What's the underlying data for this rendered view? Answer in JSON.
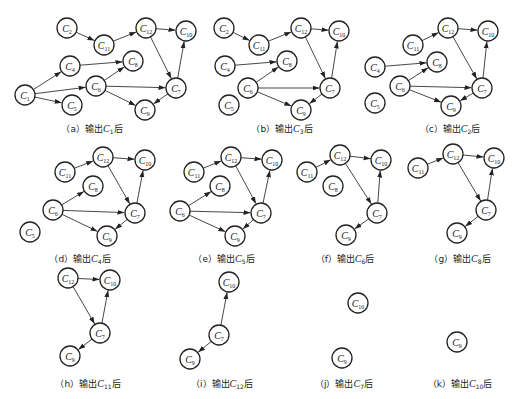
{
  "figure": {
    "node_radius": 10,
    "colors": {
      "stroke": "#222222",
      "edge": "#333333",
      "background": "#ffffff"
    },
    "panels": [
      {
        "id": "a",
        "caption_prefix": "（a）输出",
        "caption_node": "C",
        "caption_sub": "1",
        "caption_suffix": "后",
        "caption_x": 92,
        "caption_y": 122,
        "nodes": [
          {
            "id": "C2",
            "sub": "2",
            "x": 67,
            "y": 28
          },
          {
            "id": "C11",
            "sub": "11",
            "x": 104,
            "y": 45
          },
          {
            "id": "C12",
            "sub": "12",
            "x": 146,
            "y": 28
          },
          {
            "id": "C10",
            "sub": "10",
            "x": 186,
            "y": 31
          },
          {
            "id": "C4",
            "sub": "4",
            "x": 70,
            "y": 66
          },
          {
            "id": "C8",
            "sub": "8",
            "x": 133,
            "y": 61
          },
          {
            "id": "C1",
            "sub": "1",
            "x": 25,
            "y": 95
          },
          {
            "id": "C6",
            "sub": "6",
            "x": 96,
            "y": 86
          },
          {
            "id": "C7",
            "sub": "7",
            "x": 176,
            "y": 88
          },
          {
            "id": "C5",
            "sub": "5",
            "x": 72,
            "y": 105
          },
          {
            "id": "C9",
            "sub": "9",
            "x": 145,
            "y": 110
          }
        ],
        "edges": [
          [
            "C2",
            "C11"
          ],
          [
            "C11",
            "C12"
          ],
          [
            "C12",
            "C10"
          ],
          [
            "C12",
            "C7"
          ],
          [
            "C7",
            "C10"
          ],
          [
            "C1",
            "C4"
          ],
          [
            "C1",
            "C6"
          ],
          [
            "C1",
            "C5"
          ],
          [
            "C4",
            "C8"
          ],
          [
            "C6",
            "C8"
          ],
          [
            "C6",
            "C7"
          ],
          [
            "C6",
            "C9"
          ],
          [
            "C7",
            "C9"
          ]
        ]
      },
      {
        "id": "b",
        "caption_prefix": "（b）输出",
        "caption_node": "C",
        "caption_sub": "3",
        "caption_suffix": "后",
        "caption_x": 282,
        "caption_y": 122,
        "nodes": [
          {
            "id": "C2",
            "sub": "2",
            "x": 224,
            "y": 28
          },
          {
            "id": "C11",
            "sub": "11",
            "x": 259,
            "y": 45
          },
          {
            "id": "C12",
            "sub": "12",
            "x": 301,
            "y": 28
          },
          {
            "id": "C10",
            "sub": "10",
            "x": 339,
            "y": 31
          },
          {
            "id": "C4",
            "sub": "4",
            "x": 225,
            "y": 66
          },
          {
            "id": "C8",
            "sub": "8",
            "x": 287,
            "y": 61
          },
          {
            "id": "C6",
            "sub": "6",
            "x": 248,
            "y": 88
          },
          {
            "id": "C7",
            "sub": "7",
            "x": 330,
            "y": 88
          },
          {
            "id": "C5",
            "sub": "5",
            "x": 229,
            "y": 105
          },
          {
            "id": "C9",
            "sub": "9",
            "x": 301,
            "y": 110
          }
        ],
        "edges": [
          [
            "C2",
            "C11"
          ],
          [
            "C11",
            "C12"
          ],
          [
            "C12",
            "C10"
          ],
          [
            "C12",
            "C7"
          ],
          [
            "C7",
            "C10"
          ],
          [
            "C4",
            "C8"
          ],
          [
            "C6",
            "C8"
          ],
          [
            "C6",
            "C7"
          ],
          [
            "C6",
            "C9"
          ],
          [
            "C7",
            "C9"
          ]
        ]
      },
      {
        "id": "c",
        "caption_prefix": "（c）输出",
        "caption_node": "C",
        "caption_sub": "2",
        "caption_suffix": "后",
        "caption_x": 450,
        "caption_y": 122,
        "nodes": [
          {
            "id": "C11",
            "sub": "11",
            "x": 413,
            "y": 45
          },
          {
            "id": "C12",
            "sub": "12",
            "x": 448,
            "y": 28
          },
          {
            "id": "C10",
            "sub": "10",
            "x": 488,
            "y": 31
          },
          {
            "id": "C4",
            "sub": "4",
            "x": 375,
            "y": 67
          },
          {
            "id": "C8",
            "sub": "8",
            "x": 437,
            "y": 62
          },
          {
            "id": "C6",
            "sub": "6",
            "x": 400,
            "y": 86
          },
          {
            "id": "C7",
            "sub": "7",
            "x": 482,
            "y": 88
          },
          {
            "id": "C5",
            "sub": "5",
            "x": 375,
            "y": 103
          },
          {
            "id": "C9",
            "sub": "9",
            "x": 451,
            "y": 106
          }
        ],
        "edges": [
          [
            "C11",
            "C12"
          ],
          [
            "C12",
            "C10"
          ],
          [
            "C12",
            "C7"
          ],
          [
            "C7",
            "C10"
          ],
          [
            "C4",
            "C8"
          ],
          [
            "C6",
            "C8"
          ],
          [
            "C6",
            "C7"
          ],
          [
            "C6",
            "C9"
          ],
          [
            "C7",
            "C9"
          ]
        ]
      },
      {
        "id": "d",
        "caption_prefix": "（d）输出",
        "caption_node": "C",
        "caption_sub": "4",
        "caption_suffix": "后",
        "caption_x": 80,
        "caption_y": 252,
        "nodes": [
          {
            "id": "C12",
            "sub": "12",
            "x": 103,
            "y": 157
          },
          {
            "id": "C10",
            "sub": "10",
            "x": 145,
            "y": 160
          },
          {
            "id": "C11",
            "sub": "11",
            "x": 65,
            "y": 172
          },
          {
            "id": "C8",
            "sub": "8",
            "x": 93,
            "y": 186
          },
          {
            "id": "C6",
            "sub": "6",
            "x": 53,
            "y": 210
          },
          {
            "id": "C7",
            "sub": "7",
            "x": 135,
            "y": 213
          },
          {
            "id": "C5",
            "sub": "5",
            "x": 30,
            "y": 232
          },
          {
            "id": "C9",
            "sub": "9",
            "x": 107,
            "y": 236
          }
        ],
        "edges": [
          [
            "C11",
            "C12"
          ],
          [
            "C12",
            "C10"
          ],
          [
            "C12",
            "C7"
          ],
          [
            "C7",
            "C10"
          ],
          [
            "C6",
            "C8"
          ],
          [
            "C6",
            "C7"
          ],
          [
            "C6",
            "C9"
          ],
          [
            "C7",
            "C9"
          ]
        ]
      },
      {
        "id": "e",
        "caption_prefix": "（e）输出",
        "caption_node": "C",
        "caption_sub": "5",
        "caption_suffix": "后",
        "caption_x": 224,
        "caption_y": 252,
        "nodes": [
          {
            "id": "C12",
            "sub": "12",
            "x": 231,
            "y": 157
          },
          {
            "id": "C10",
            "sub": "10",
            "x": 272,
            "y": 160
          },
          {
            "id": "C11",
            "sub": "11",
            "x": 194,
            "y": 172
          },
          {
            "id": "C8",
            "sub": "8",
            "x": 220,
            "y": 186
          },
          {
            "id": "C6",
            "sub": "6",
            "x": 180,
            "y": 211
          },
          {
            "id": "C7",
            "sub": "7",
            "x": 261,
            "y": 213
          },
          {
            "id": "C9",
            "sub": "9",
            "x": 235,
            "y": 236
          }
        ],
        "edges": [
          [
            "C11",
            "C12"
          ],
          [
            "C12",
            "C10"
          ],
          [
            "C12",
            "C7"
          ],
          [
            "C7",
            "C10"
          ],
          [
            "C6",
            "C8"
          ],
          [
            "C6",
            "C7"
          ],
          [
            "C6",
            "C9"
          ],
          [
            "C7",
            "C9"
          ]
        ]
      },
      {
        "id": "f",
        "caption_prefix": "（f）输出",
        "caption_node": "C",
        "caption_sub": "6",
        "caption_suffix": "后",
        "caption_x": 345,
        "caption_y": 252,
        "nodes": [
          {
            "id": "C12",
            "sub": "12",
            "x": 340,
            "y": 155
          },
          {
            "id": "C10",
            "sub": "10",
            "x": 381,
            "y": 160
          },
          {
            "id": "C11",
            "sub": "11",
            "x": 307,
            "y": 172
          },
          {
            "id": "C8",
            "sub": "8",
            "x": 333,
            "y": 186
          },
          {
            "id": "C7",
            "sub": "7",
            "x": 377,
            "y": 213
          },
          {
            "id": "C9",
            "sub": "9",
            "x": 346,
            "y": 235
          }
        ],
        "edges": [
          [
            "C11",
            "C12"
          ],
          [
            "C12",
            "C10"
          ],
          [
            "C12",
            "C7"
          ],
          [
            "C7",
            "C10"
          ],
          [
            "C7",
            "C9"
          ]
        ]
      },
      {
        "id": "g",
        "caption_prefix": "（g）输出",
        "caption_node": "C",
        "caption_sub": "8",
        "caption_suffix": "后",
        "caption_x": 460,
        "caption_y": 252,
        "nodes": [
          {
            "id": "C12",
            "sub": "12",
            "x": 453,
            "y": 154
          },
          {
            "id": "C10",
            "sub": "10",
            "x": 494,
            "y": 158
          },
          {
            "id": "C11",
            "sub": "11",
            "x": 418,
            "y": 168
          },
          {
            "id": "C7",
            "sub": "7",
            "x": 486,
            "y": 210
          },
          {
            "id": "C9",
            "sub": "9",
            "x": 457,
            "y": 233
          }
        ],
        "edges": [
          [
            "C11",
            "C12"
          ],
          [
            "C12",
            "C10"
          ],
          [
            "C12",
            "C7"
          ],
          [
            "C7",
            "C10"
          ],
          [
            "C7",
            "C9"
          ]
        ]
      },
      {
        "id": "h",
        "caption_prefix": "（h）输出",
        "caption_node": "C",
        "caption_sub": "11",
        "caption_suffix": "后",
        "caption_x": 88,
        "caption_y": 377,
        "nodes": [
          {
            "id": "C12",
            "sub": "12",
            "x": 68,
            "y": 278
          },
          {
            "id": "C10",
            "sub": "10",
            "x": 110,
            "y": 280
          },
          {
            "id": "C7",
            "sub": "7",
            "x": 100,
            "y": 333
          },
          {
            "id": "C9",
            "sub": "9",
            "x": 70,
            "y": 356
          }
        ],
        "edges": [
          [
            "C12",
            "C10"
          ],
          [
            "C12",
            "C7"
          ],
          [
            "C7",
            "C10"
          ],
          [
            "C7",
            "C9"
          ]
        ]
      },
      {
        "id": "i",
        "caption_prefix": "（i）输出",
        "caption_node": "C",
        "caption_sub": "12",
        "caption_suffix": "后",
        "caption_x": 222,
        "caption_y": 377,
        "nodes": [
          {
            "id": "C10",
            "sub": "10",
            "x": 229,
            "y": 282
          },
          {
            "id": "C7",
            "sub": "7",
            "x": 219,
            "y": 335
          },
          {
            "id": "C9",
            "sub": "9",
            "x": 190,
            "y": 359
          }
        ],
        "edges": [
          [
            "C7",
            "C10"
          ],
          [
            "C7",
            "C9"
          ]
        ]
      },
      {
        "id": "j",
        "caption_prefix": "（j）输出",
        "caption_node": "C",
        "caption_sub": "7",
        "caption_suffix": "后",
        "caption_x": 344,
        "caption_y": 377,
        "nodes": [
          {
            "id": "C10",
            "sub": "10",
            "x": 358,
            "y": 303
          },
          {
            "id": "C9",
            "sub": "9",
            "x": 342,
            "y": 358
          }
        ],
        "edges": []
      },
      {
        "id": "k",
        "caption_prefix": "（k）输出",
        "caption_node": "C",
        "caption_sub": "10",
        "caption_suffix": "后",
        "caption_x": 460,
        "caption_y": 377,
        "nodes": [
          {
            "id": "C9",
            "sub": "9",
            "x": 457,
            "y": 342
          }
        ],
        "edges": []
      }
    ]
  }
}
